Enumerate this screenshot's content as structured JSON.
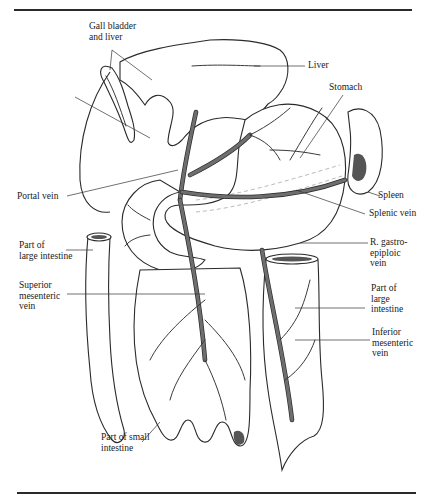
{
  "figure": {
    "labels": {
      "gall_bladder_liver": "Gall bladder\nand liver",
      "liver": "Liver",
      "stomach": "Stomach",
      "spleen": "Spleen",
      "splenic_vein": "Splenic vein",
      "r_gastro": "R. gastro-\nepiploic\nvein",
      "portal_vein": "Portal vein",
      "large_intestine_left": "Part of\nlarge intestine",
      "superior_mesenteric": "Superior\nmesenteric\nvein",
      "large_intestine_right": "Part of\nlarge\nintestine",
      "inferior_mesenteric": "Inferior\nmesenteric\nvein",
      "small_intestine": "Part of small\nintestine"
    },
    "colors": {
      "line": "#2a2a2a",
      "vein_fill": "#6e6e6e",
      "background": "#ffffff"
    }
  }
}
